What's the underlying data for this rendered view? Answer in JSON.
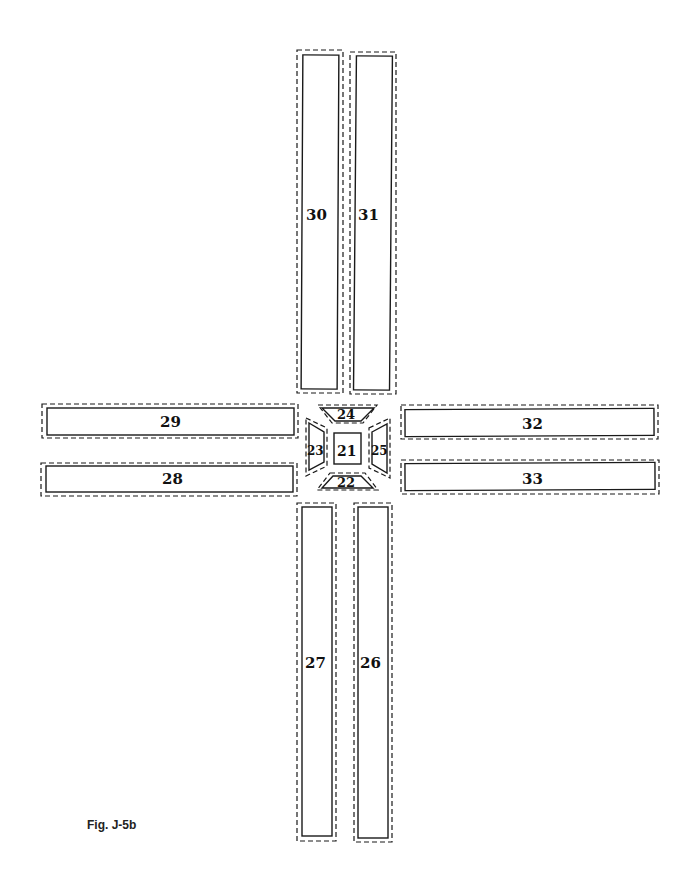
{
  "figure": {
    "caption": "Fig. J-5b",
    "colors": {
      "outline": "#1a1a1a",
      "background": "#ffffff"
    }
  },
  "pieces": [
    {
      "id": "21",
      "label": "21",
      "shape": "square",
      "position": "center"
    },
    {
      "id": "22",
      "label": "22",
      "shape": "trapezoid",
      "position": "center-bottom"
    },
    {
      "id": "23",
      "label": "23",
      "shape": "trapezoid",
      "position": "center-left"
    },
    {
      "id": "24",
      "label": "24",
      "shape": "trapezoid",
      "position": "center-top"
    },
    {
      "id": "25",
      "label": "25",
      "shape": "trapezoid",
      "position": "center-right"
    },
    {
      "id": "26",
      "label": "26",
      "shape": "strip",
      "position": "bottom-right"
    },
    {
      "id": "27",
      "label": "27",
      "shape": "strip",
      "position": "bottom-left"
    },
    {
      "id": "28",
      "label": "28",
      "shape": "strip",
      "position": "left-lower"
    },
    {
      "id": "29",
      "label": "29",
      "shape": "strip",
      "position": "left-upper"
    },
    {
      "id": "30",
      "label": "30",
      "shape": "strip",
      "position": "top-left"
    },
    {
      "id": "31",
      "label": "31",
      "shape": "strip",
      "position": "top-right"
    },
    {
      "id": "32",
      "label": "32",
      "shape": "strip",
      "position": "right-upper"
    },
    {
      "id": "33",
      "label": "33",
      "shape": "strip",
      "position": "right-lower"
    }
  ]
}
